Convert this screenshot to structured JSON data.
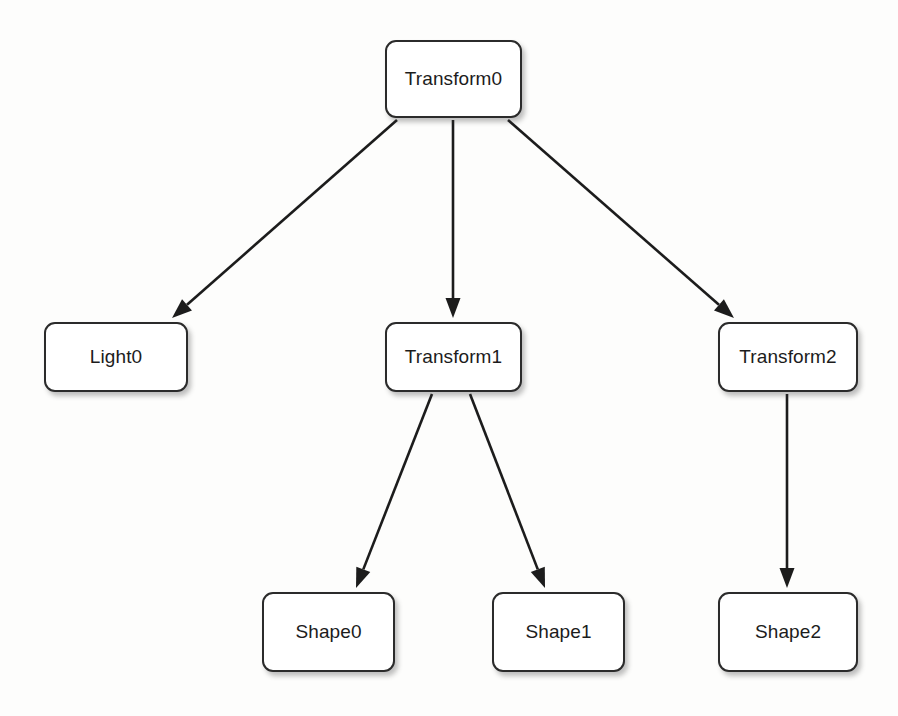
{
  "diagram": {
    "type": "tree",
    "background_color": "#fdfdfc",
    "node_fill_color": "#ffffff",
    "node_border_color": "#2b2b2b",
    "edge_color": "#1c1c1c",
    "label_color": "#1c1c1c"
  },
  "nodes": [
    {
      "id": "transform0",
      "label": "Transform0",
      "x": 385,
      "y": 40,
      "width": 137,
      "height": 78,
      "level": 0
    },
    {
      "id": "light0",
      "label": "Light0",
      "x": 44,
      "y": 322,
      "width": 144,
      "height": 70,
      "level": 1
    },
    {
      "id": "transform1",
      "label": "Transform1",
      "x": 385,
      "y": 322,
      "width": 137,
      "height": 70,
      "level": 1
    },
    {
      "id": "transform2",
      "label": "Transform2",
      "x": 718,
      "y": 322,
      "width": 140,
      "height": 70,
      "level": 1
    },
    {
      "id": "shape0",
      "label": "Shape0",
      "x": 262,
      "y": 592,
      "width": 133,
      "height": 80,
      "level": 2
    },
    {
      "id": "shape1",
      "label": "Shape1",
      "x": 492,
      "y": 592,
      "width": 133,
      "height": 80,
      "level": 2
    },
    {
      "id": "shape2",
      "label": "Shape2",
      "x": 718,
      "y": 592,
      "width": 140,
      "height": 80,
      "level": 2
    }
  ],
  "edges": [
    {
      "id": "edge-transform0-light0",
      "from": "transform0",
      "to": "light0",
      "x1": 397,
      "y1": 120,
      "x2": 172,
      "y2": 318
    },
    {
      "id": "edge-transform0-transform1",
      "from": "transform0",
      "to": "transform1",
      "x1": 453,
      "y1": 120,
      "x2": 453,
      "y2": 318
    },
    {
      "id": "edge-transform0-transform2",
      "from": "transform0",
      "to": "transform2",
      "x1": 508,
      "y1": 120,
      "x2": 734,
      "y2": 318
    },
    {
      "id": "edge-transform1-shape0",
      "from": "transform1",
      "to": "shape0",
      "x1": 432,
      "y1": 394,
      "x2": 356,
      "y2": 588
    },
    {
      "id": "edge-transform1-shape1",
      "from": "transform1",
      "to": "shape1",
      "x1": 470,
      "y1": 394,
      "x2": 545,
      "y2": 588
    },
    {
      "id": "edge-transform2-shape2",
      "from": "transform2",
      "to": "shape2",
      "x1": 787,
      "y1": 394,
      "x2": 787,
      "y2": 588
    }
  ]
}
